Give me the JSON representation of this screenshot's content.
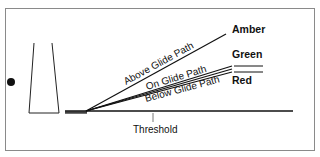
{
  "diagram": {
    "paths": [
      {
        "label": "Above Glide Path",
        "light": "Amber"
      },
      {
        "label": "On Glide Path",
        "light": "Green"
      },
      {
        "label": "Below Glide Path",
        "light": "Red"
      }
    ],
    "lights": {
      "amber": "Amber",
      "green": "Green",
      "red": "Red"
    },
    "threshold_label": "Threshold",
    "colors": {
      "line": "#111111",
      "frame": "#8a8a8a",
      "background": "#ffffff"
    }
  }
}
